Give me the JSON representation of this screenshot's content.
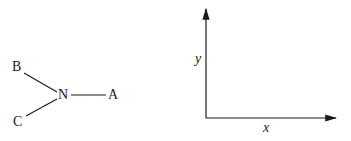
{
  "molecule": {
    "center": "N",
    "substituents": [
      "A",
      "B",
      "C"
    ]
  },
  "axes": {
    "x_label": "x",
    "y_label": "y"
  },
  "colors": {
    "ink": "#1a1a1a",
    "background": "#ffffff"
  }
}
